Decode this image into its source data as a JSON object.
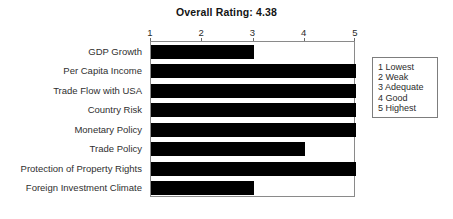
{
  "chart_data": {
    "type": "bar",
    "orientation": "horizontal",
    "title": "Overall Rating: 4.38",
    "xlabel": "",
    "ylabel": "",
    "xlim": [
      1,
      5
    ],
    "xticks": [
      "1",
      "2",
      "3",
      "4",
      "5"
    ],
    "xtick_values": [
      1,
      2,
      3,
      4,
      5
    ],
    "grid": false,
    "axis_position": "top",
    "bar_color": "#000000",
    "categories": [
      "GDP Growth",
      "Per Capita Income",
      "Trade Flow with USA",
      "Country Risk",
      "Monetary Policy",
      "Trade Policy",
      "Protection of Property Rights",
      "Foreign Investment Climate"
    ],
    "values": [
      3,
      5,
      5,
      5,
      5,
      4,
      5,
      3
    ],
    "legend_position": "right-outside",
    "legend_entries": [
      "1 Lowest",
      "2 Weak",
      "3 Adequate",
      "4 Good",
      "5 Highest"
    ]
  }
}
